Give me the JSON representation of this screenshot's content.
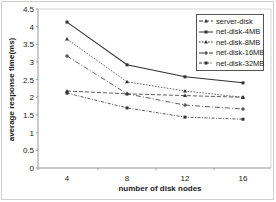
{
  "chart_data": {
    "type": "line",
    "title": "",
    "xlabel": "number of disk nodes",
    "ylabel": "average response time(ms)",
    "x": [
      4,
      8,
      12,
      16
    ],
    "ylim": [
      0,
      4.5
    ],
    "yticks": [
      "0",
      "0.5",
      "1",
      "1.5",
      "2",
      "2.5",
      "3",
      "3.5",
      "4",
      "4.5"
    ],
    "xticks": [
      "4",
      "8",
      "12",
      "16"
    ],
    "grid": false,
    "legend_position": "upper right",
    "series": [
      {
        "name": "server-disk",
        "values": [
          2.18,
          2.1,
          2.05,
          2.0
        ]
      },
      {
        "name": "net-disk-4MB",
        "values": [
          4.13,
          2.92,
          2.58,
          2.41
        ]
      },
      {
        "name": "net-disk-8MB",
        "values": [
          3.65,
          2.44,
          2.18,
          2.0
        ]
      },
      {
        "name": "net-disk-16MB",
        "values": [
          3.17,
          2.1,
          1.78,
          1.67
        ]
      },
      {
        "name": "net-disk-32MB",
        "values": [
          2.12,
          1.7,
          1.44,
          1.38
        ]
      }
    ]
  },
  "legend": {
    "items": [
      {
        "label": "server-disk"
      },
      {
        "label": "net-disk-4MB"
      },
      {
        "label": "net-disk-8MB"
      },
      {
        "label": "net-disk-16MB"
      },
      {
        "label": "net-disk-32MB"
      }
    ]
  },
  "style": {
    "line_color": "#333333",
    "axis_color": "#999999",
    "dash": [
      "4,2",
      "",
      "1.5,1.5",
      "5,2,1,2",
      "3,1.5,1,1.5"
    ]
  }
}
